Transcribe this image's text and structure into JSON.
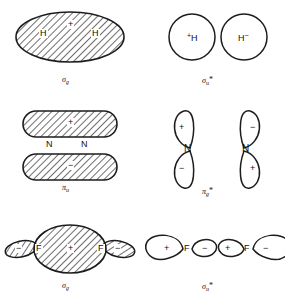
{
  "figure": {
    "background_color": "#ffffff",
    "line_color": "#1d1d1d",
    "hatch_color": "#555555"
  },
  "panels": [
    {
      "id": "sigma-g-h2",
      "position": "top-left",
      "molecule": "H2",
      "orbital_type": "bonding",
      "shape": "filled-ellipse",
      "mo_symbol": "σ",
      "mo_subscript": "g",
      "mo_star": "",
      "mo_label_text": "σg",
      "atoms": [
        {
          "label": "H",
          "x": 44,
          "y": 33
        },
        {
          "label": "H",
          "x": 96,
          "y": 33
        }
      ],
      "signs": [
        {
          "text": "+",
          "x": 70,
          "y": 25
        }
      ]
    },
    {
      "id": "sigma-u-star-h2",
      "position": "top-right",
      "molecule": "H2",
      "orbital_type": "antibonding",
      "shape": "two-open-circles",
      "mo_symbol": "σ",
      "mo_subscript": "u",
      "mo_star": "*",
      "mo_label_text": "σu*",
      "atoms": [
        {
          "label": "H",
          "sign": "+",
          "sign_side": "left",
          "x": 192,
          "y": 37
        },
        {
          "label": "H",
          "sign": "−",
          "sign_side": "right",
          "x": 244,
          "y": 37
        }
      ],
      "signs": []
    },
    {
      "id": "pi-u-n2",
      "position": "middle-left",
      "molecule": "N2",
      "orbital_type": "bonding",
      "shape": "two-stacked-filled-lobes",
      "mo_symbol": "π",
      "mo_subscript": "u",
      "mo_star": "",
      "mo_label_text": "πu",
      "atoms": [
        {
          "label": "N",
          "x": 50,
          "y": 144
        },
        {
          "label": "N",
          "x": 84,
          "y": 144
        }
      ],
      "signs": [
        {
          "text": "+",
          "x": 70,
          "y": 122
        },
        {
          "text": "−",
          "x": 70,
          "y": 166
        }
      ]
    },
    {
      "id": "pi-g-star-n2",
      "position": "middle-right",
      "molecule": "N2",
      "orbital_type": "antibonding",
      "shape": "two-vertical-p-orbitals",
      "mo_symbol": "π",
      "mo_subscript": "g",
      "mo_star": "*",
      "mo_label_text": "πg*",
      "atoms": [
        {
          "label": "N",
          "x": 186,
          "y": 148
        },
        {
          "label": "N",
          "x": 246,
          "y": 148
        }
      ],
      "signs": [
        {
          "text": "+",
          "x": 180,
          "y": 127
        },
        {
          "text": "−",
          "x": 180,
          "y": 168
        },
        {
          "text": "−",
          "x": 252,
          "y": 127
        },
        {
          "text": "+",
          "x": 252,
          "y": 168
        }
      ]
    },
    {
      "id": "sigma-g-f2",
      "position": "bottom-left",
      "molecule": "F2",
      "orbital_type": "bonding",
      "shape": "large-filled-ellipse-with-small-end-lobes",
      "mo_symbol": "σ",
      "mo_subscript": "g",
      "mo_star": "",
      "mo_label_text": "σg",
      "atoms": [
        {
          "label": "F",
          "x": 38,
          "y": 248
        },
        {
          "label": "F",
          "x": 100,
          "y": 248
        }
      ],
      "signs": [
        {
          "text": "+",
          "x": 70,
          "y": 248
        },
        {
          "text": "−",
          "x": 18,
          "y": 248
        },
        {
          "text": "−",
          "x": 120,
          "y": 248
        }
      ]
    },
    {
      "id": "sigma-u-star-f2",
      "position": "bottom-right",
      "molecule": "F2",
      "orbital_type": "antibonding",
      "shape": "two-horizontal-p-orbitals",
      "mo_symbol": "σ",
      "mo_subscript": "u",
      "mo_star": "*",
      "mo_label_text": "σu*",
      "atoms": [
        {
          "label": "F",
          "x": 186,
          "y": 248
        },
        {
          "label": "F",
          "x": 246,
          "y": 248
        }
      ],
      "signs": [
        {
          "text": "+",
          "x": 167,
          "y": 248
        },
        {
          "text": "−",
          "x": 205,
          "y": 248
        },
        {
          "text": "+",
          "x": 227,
          "y": 248
        },
        {
          "text": "−",
          "x": 265,
          "y": 248
        }
      ]
    }
  ],
  "labels": {
    "sigma_g_top": "σ",
    "sigma_u_star_top": "σ",
    "pi_u": "π",
    "pi_g_star": "π",
    "sigma_g_bottom": "σ",
    "sigma_u_star_bottom": "σ",
    "sub_g": "g",
    "sub_u": "u",
    "star": "*",
    "atom_h": "H",
    "atom_n": "N",
    "atom_f": "F",
    "plus": "+",
    "minus": "−"
  }
}
